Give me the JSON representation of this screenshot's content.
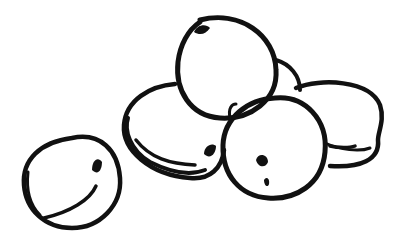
{
  "image": {
    "subject": "line drawing of apricots",
    "fruit_count": 6,
    "background": "#ffffff",
    "ink": "#111111"
  }
}
